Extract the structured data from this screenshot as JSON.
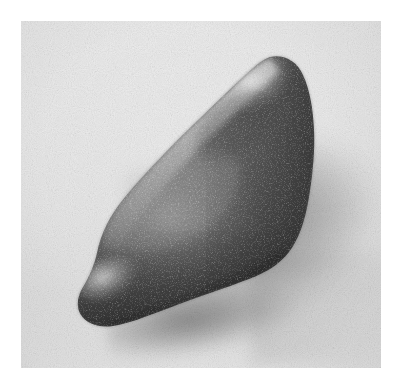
{
  "page": {
    "background_color": "#ffffff",
    "width": 398,
    "height": 383
  },
  "photograph": {
    "caption": "",
    "medium": "black-and-white photograph",
    "subject": "polished stone celt / adze artifact",
    "frame": {
      "left": 21,
      "top": 21,
      "width": 360,
      "height": 347,
      "border": "none"
    },
    "backdrop": {
      "description": "plain light grey studio backdrop with fine paper grain",
      "base_color": "#e8e8e8",
      "highlight_color": "#f1f1f1",
      "shadow_color": "#9a9a9a"
    },
    "lighting": {
      "key_light_direction": "upper-left",
      "cast_shadow_direction": "lower-right"
    },
    "object": {
      "name": "stone-artifact",
      "orientation": "tilted, pointed end lower-left, rounded lobe upper-right",
      "surface": "granular speckled polished stone",
      "tones": {
        "darkest": "#1c1c1c",
        "mid": "#4f4f4f",
        "light": "#8d8d8d",
        "specular_highlight": "#e6e6e6"
      },
      "highlights": [
        {
          "name": "upper-left-ridge-highlight",
          "tone": "#dcdcdc"
        },
        {
          "name": "lower-left-tip-highlight",
          "tone": "#cfcfcf"
        }
      ]
    }
  }
}
